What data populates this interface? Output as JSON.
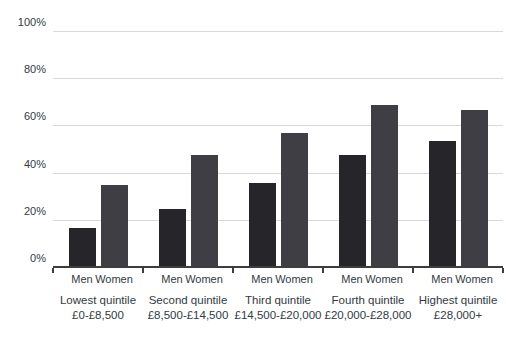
{
  "chart_data": {
    "type": "bar",
    "title": "",
    "xlabel": "",
    "ylabel": "",
    "ylim": [
      0,
      100
    ],
    "grid": true,
    "legend_position": "none (series labels shown under each bar group)",
    "yticks": [
      {
        "value": 0,
        "label": "0%"
      },
      {
        "value": 20,
        "label": "20%"
      },
      {
        "value": 40,
        "label": "40%"
      },
      {
        "value": 60,
        "label": "60%"
      },
      {
        "value": 80,
        "label": "80%"
      },
      {
        "value": 100,
        "label": "100%"
      }
    ],
    "categories": [
      {
        "title": "Lowest quintile",
        "range": "£0-£8,500"
      },
      {
        "title": "Second quintile",
        "range": "£8,500-£14,500"
      },
      {
        "title": "Third quintile",
        "range": "£14,500-£20,000"
      },
      {
        "title": "Fourth quintile",
        "range": "£20,000-£28,000"
      },
      {
        "title": "Highest quintile",
        "range": "£28,000+"
      }
    ],
    "series": [
      {
        "name": "Men",
        "color": "#25252a",
        "values": [
          17,
          25,
          36,
          48,
          54
        ]
      },
      {
        "name": "Women",
        "color": "#3e3e44",
        "values": [
          35,
          48,
          57,
          69,
          67
        ]
      }
    ]
  },
  "style": {
    "gridline_color": "#d9d9d9",
    "axis_color": "#3d3d3d",
    "text_color": "#323a43",
    "background": "#ffffff"
  }
}
